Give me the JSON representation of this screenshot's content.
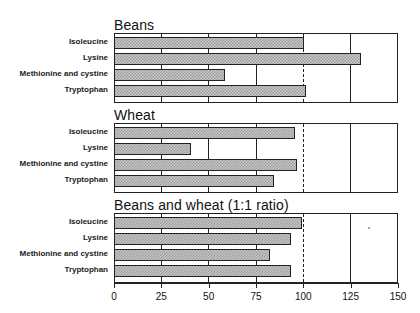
{
  "chart_data": {
    "type": "bar",
    "orientation": "horizontal",
    "title": "",
    "xlabel": "",
    "ylabel": "",
    "xlim": [
      0,
      150
    ],
    "x_ticks": [
      0,
      25,
      50,
      75,
      100,
      125,
      150
    ],
    "x_tick_labels": [
      "0",
      "25",
      "50",
      "75",
      "100",
      "125",
      "150"
    ],
    "reference_line": {
      "x": 100,
      "style": "dashed"
    },
    "gridlines": [
      25,
      50,
      75,
      125
    ],
    "categories": [
      "Isoleucine",
      "Lysine",
      "Methionine and cystine",
      "Tryptophan"
    ],
    "panels": [
      {
        "title": "Beans",
        "values": [
          100,
          130,
          58,
          101
        ]
      },
      {
        "title": "Wheat",
        "values": [
          95,
          40,
          96,
          84
        ]
      },
      {
        "title": "Beans and wheat (1:1 ratio)",
        "values": [
          99,
          93,
          82,
          93
        ]
      }
    ],
    "series": [
      {
        "name": "Beans",
        "values": [
          100,
          130,
          58,
          101
        ]
      },
      {
        "name": "Wheat",
        "values": [
          95,
          40,
          96,
          84
        ]
      },
      {
        "name": "Beans and wheat (1:1 ratio)",
        "values": [
          99,
          93,
          82,
          93
        ]
      }
    ],
    "legend": null,
    "grid": true
  },
  "colors": {
    "bar_fill": "#c4c4c4",
    "bar_pattern": "#9a9a9a",
    "outline": "#222222",
    "background": "#ffffff"
  }
}
